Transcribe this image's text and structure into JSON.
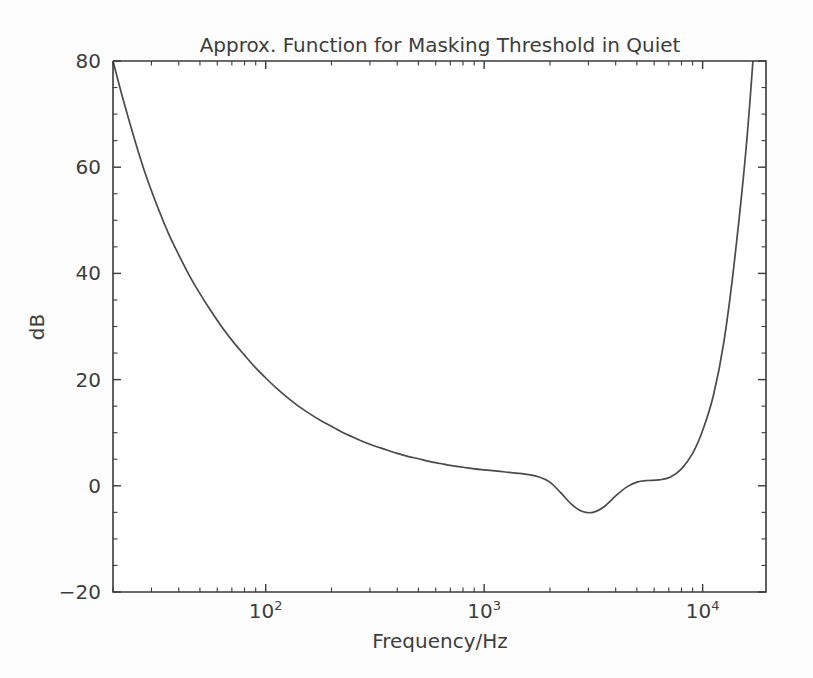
{
  "chart_data": {
    "type": "line",
    "title": "Approx. Function for Masking Threshold in Quiet",
    "xlabel": "Frequency/Hz",
    "ylabel": "dB",
    "xscale": "log",
    "yscale": "linear",
    "xlim": [
      20,
      19500
    ],
    "ylim": [
      -20,
      80
    ],
    "grid": false,
    "legend": null,
    "xtick_labels": [
      "10^2",
      "10^3",
      "10^4"
    ],
    "xtick_values": [
      100,
      1000,
      10000
    ],
    "xtick_mantissa": "10",
    "xtick_exponents": [
      "2",
      "3",
      "4"
    ],
    "ytick_labels": [
      "-20",
      "0",
      "20",
      "40",
      "60",
      "80"
    ],
    "ytick_values": [
      -20,
      0,
      20,
      40,
      60,
      80
    ],
    "line_color": "#4a4a4a",
    "background_color": "#fdfdfd",
    "series": [
      {
        "name": "Masking threshold in quiet",
        "x": [
          20,
          22,
          25,
          28,
          32,
          36,
          40,
          45,
          50,
          56,
          63,
          71,
          80,
          90,
          100,
          112,
          125,
          140,
          160,
          180,
          200,
          224,
          250,
          280,
          315,
          355,
          400,
          450,
          500,
          560,
          630,
          710,
          800,
          900,
          1000,
          1120,
          1250,
          1400,
          1600,
          1800,
          2000,
          2240,
          2500,
          2800,
          3150,
          3550,
          4000,
          4500,
          5000,
          5600,
          6300,
          7100,
          8000,
          9000,
          10000,
          11200,
          12500,
          14000,
          16000,
          18000,
          19500
        ],
        "y": [
          80.0,
          73.5,
          65.5,
          59.0,
          52.5,
          47.4,
          43.5,
          39.4,
          36.2,
          33.0,
          29.9,
          27.1,
          24.6,
          22.2,
          20.3,
          18.4,
          16.7,
          15.1,
          13.5,
          12.2,
          11.2,
          10.1,
          9.2,
          8.3,
          7.5,
          6.8,
          6.1,
          5.5,
          5.1,
          4.6,
          4.2,
          3.8,
          3.5,
          3.2,
          3.0,
          2.8,
          2.6,
          2.4,
          2.1,
          1.6,
          0.7,
          -1.3,
          -3.4,
          -4.8,
          -5.0,
          -3.9,
          -1.9,
          -0.2,
          0.7,
          1.0,
          1.1,
          1.6,
          3.2,
          6.1,
          10.4,
          17.0,
          27.0,
          42.5,
          66.0,
          96.0,
          125.0
        ],
        "key_points": [
          {
            "freq": 20,
            "db": 80,
            "note": "left edge top"
          },
          {
            "freq": 100,
            "db": 20.3,
            "note": "10^2 decade"
          },
          {
            "freq": 1000,
            "db": 3.0,
            "note": "10^3 decade"
          },
          {
            "freq": 3500,
            "db": -5.0,
            "note": "minimum"
          },
          {
            "freq": 6000,
            "db": 1.1,
            "note": "local plateau"
          },
          {
            "freq": 10000,
            "db": 10.4,
            "note": "10^4 decade"
          },
          {
            "freq": 17500,
            "db": 80,
            "note": "reaches top of axis"
          }
        ]
      }
    ]
  }
}
